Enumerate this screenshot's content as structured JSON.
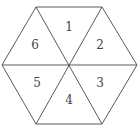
{
  "diagram": {
    "shape": "regular hexagon divided into 6 triangles",
    "regions": [
      {
        "id": 1,
        "label": "1",
        "x": 69,
        "y": 28
      },
      {
        "id": 2,
        "label": "2",
        "x": 100,
        "y": 44
      },
      {
        "id": 3,
        "label": "3",
        "x": 100,
        "y": 84
      },
      {
        "id": 4,
        "label": "4",
        "x": 69,
        "y": 101
      },
      {
        "id": 5,
        "label": "5",
        "x": 37,
        "y": 84
      },
      {
        "id": 6,
        "label": "6",
        "x": 35,
        "y": 44
      }
    ],
    "colors": {
      "stroke": "#5a5a5a",
      "text": "#444444",
      "background": "#ffffff"
    }
  }
}
